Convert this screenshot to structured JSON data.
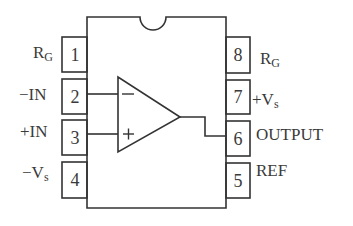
{
  "diagram": {
    "type": "IC pinout",
    "component": "instrumentation amplifier",
    "left_pins": [
      {
        "number": "1",
        "label": "R",
        "sub": "G"
      },
      {
        "number": "2",
        "label": "−IN",
        "sub": ""
      },
      {
        "number": "3",
        "label": "+IN",
        "sub": ""
      },
      {
        "number": "4",
        "label": "−V",
        "sub": "s"
      }
    ],
    "right_pins": [
      {
        "number": "8",
        "label": "R",
        "sub": "G"
      },
      {
        "number": "7",
        "label": "+V",
        "sub": "s"
      },
      {
        "number": "6",
        "label": "OUTPUT",
        "sub": ""
      },
      {
        "number": "5",
        "label": "REF",
        "sub": ""
      }
    ],
    "opamp": {
      "minus_sign": "−",
      "plus_sign": "+"
    }
  }
}
